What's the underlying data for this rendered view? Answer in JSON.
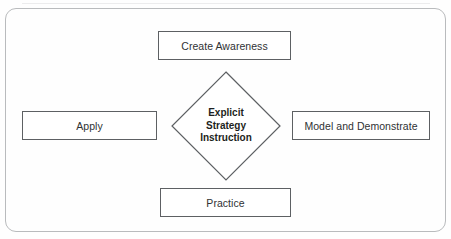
{
  "diagram": {
    "center": {
      "shape": "diamond",
      "label_lines": [
        "Explicit",
        "Strategy",
        "Instruction"
      ],
      "line1": "Explicit",
      "line2": "Strategy",
      "line3": "Instruction"
    },
    "nodes": {
      "top": "Create Awareness",
      "left": "Apply",
      "right": "Model and Demonstrate",
      "bottom": "Practice"
    },
    "colors": {
      "box_border": "#5d6063",
      "frame_border": "#b9bbbd",
      "diamond_stroke": "#5d6063",
      "text": "#2f3234",
      "center_text": "#1d1f21",
      "background": "#fefefe"
    }
  }
}
